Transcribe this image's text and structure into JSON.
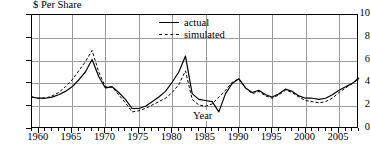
{
  "chart_data": {
    "type": "line",
    "title": "",
    "ylabel": "$ Per Share",
    "xlabel": "Year",
    "ylim": [
      0,
      10
    ],
    "xlim": [
      1959,
      2008
    ],
    "grid": true,
    "legend_position": "top-right-inside",
    "ytick_labels": [
      "0",
      "2",
      "4",
      "6",
      "8",
      "10"
    ],
    "ytick_values": [
      0,
      2,
      4,
      6,
      8,
      10
    ],
    "xtick_labels": [
      "1960",
      "1965",
      "1970",
      "1975",
      "1980",
      "1985",
      "1990",
      "1995",
      "2000",
      "2005"
    ],
    "xtick_values": [
      1960,
      1965,
      1970,
      1975,
      1980,
      1985,
      1990,
      1995,
      2000,
      2005
    ],
    "x": [
      1959,
      1960,
      1961,
      1962,
      1963,
      1964,
      1965,
      1966,
      1967,
      1968,
      1969,
      1970,
      1971,
      1972,
      1973,
      1974,
      1975,
      1976,
      1977,
      1978,
      1979,
      1980,
      1981,
      1982,
      1983,
      1984,
      1985,
      1986,
      1987,
      1988,
      1989,
      1990,
      1991,
      1992,
      1993,
      1994,
      1995,
      1996,
      1997,
      1998,
      1999,
      2000,
      2001,
      2002,
      2003,
      2004,
      2005,
      2006,
      2007,
      2008
    ],
    "series": [
      {
        "name": "actual",
        "style": "solid",
        "values": [
          2.8,
          2.7,
          2.7,
          2.8,
          3.0,
          3.3,
          3.7,
          4.3,
          5.0,
          6.1,
          4.6,
          3.6,
          3.7,
          3.2,
          2.6,
          1.8,
          1.8,
          2.0,
          2.4,
          2.8,
          3.3,
          4.1,
          5.0,
          6.4,
          3.1,
          2.6,
          2.5,
          2.4,
          1.5,
          3.1,
          4.0,
          4.4,
          3.6,
          3.2,
          3.4,
          3.0,
          2.8,
          3.1,
          3.5,
          3.3,
          2.9,
          2.7,
          2.7,
          2.6,
          2.7,
          3.0,
          3.4,
          3.7,
          4.0,
          4.5
        ]
      },
      {
        "name": "simulated",
        "style": "dashed",
        "values": [
          2.8,
          2.7,
          2.7,
          2.9,
          3.2,
          3.7,
          4.3,
          5.1,
          5.9,
          6.9,
          5.0,
          3.7,
          3.7,
          3.0,
          2.3,
          1.5,
          1.6,
          1.8,
          2.1,
          2.4,
          2.7,
          3.2,
          3.9,
          5.1,
          2.6,
          2.1,
          2.0,
          2.2,
          2.8,
          3.4,
          4.1,
          4.4,
          3.6,
          3.1,
          3.3,
          2.9,
          2.7,
          3.0,
          3.4,
          3.2,
          2.8,
          2.5,
          2.4,
          2.3,
          2.4,
          2.7,
          3.2,
          3.6,
          4.0,
          4.4
        ]
      }
    ]
  },
  "legend": {
    "items": [
      {
        "label": "actual",
        "style": "solid"
      },
      {
        "label": "simulated",
        "style": "dashed"
      }
    ]
  }
}
